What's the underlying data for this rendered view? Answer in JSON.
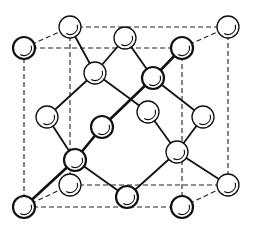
{
  "diagram": {
    "colors": {
      "line": "#111111",
      "atom_fill": "#ffffff",
      "background": "#ffffff"
    },
    "atom_radius": 11,
    "cube": {
      "front": [
        [
          24,
          48
        ],
        [
          182,
          48
        ],
        [
          182,
          207
        ],
        [
          24,
          207
        ]
      ],
      "back": [
        [
          70,
          27
        ],
        [
          228,
          27
        ],
        [
          228,
          185
        ],
        [
          70,
          185
        ]
      ]
    },
    "atoms": [
      {
        "id": "back-top-left",
        "x": 70,
        "y": 27,
        "type": "corner"
      },
      {
        "id": "back-top-right",
        "x": 228,
        "y": 27,
        "type": "corner"
      },
      {
        "id": "back-bottom-left",
        "x": 70,
        "y": 185,
        "type": "corner"
      },
      {
        "id": "back-bottom-right",
        "x": 228,
        "y": 185,
        "type": "corner"
      },
      {
        "id": "front-top-left",
        "x": 24,
        "y": 48,
        "type": "corner",
        "front": true
      },
      {
        "id": "front-top-right",
        "x": 182,
        "y": 48,
        "type": "corner",
        "front": true
      },
      {
        "id": "front-bottom-left",
        "x": 24,
        "y": 207,
        "type": "corner",
        "front": true
      },
      {
        "id": "front-bottom-right",
        "x": 182,
        "y": 207,
        "type": "corner",
        "front": true
      },
      {
        "id": "face-top",
        "x": 125,
        "y": 38,
        "type": "face"
      },
      {
        "id": "face-bottom",
        "x": 127,
        "y": 197,
        "type": "face",
        "front": true
      },
      {
        "id": "face-left",
        "x": 47,
        "y": 117,
        "type": "face"
      },
      {
        "id": "face-right",
        "x": 203,
        "y": 117,
        "type": "face"
      },
      {
        "id": "face-front",
        "x": 102,
        "y": 127,
        "type": "face",
        "front": true
      },
      {
        "id": "face-back",
        "x": 148,
        "y": 112,
        "type": "face"
      },
      {
        "id": "interior-1",
        "x": 95,
        "y": 73,
        "type": "interior"
      },
      {
        "id": "interior-2",
        "x": 153,
        "y": 78,
        "type": "interior",
        "front": true
      },
      {
        "id": "interior-3",
        "x": 75,
        "y": 160,
        "type": "interior",
        "front": true
      },
      {
        "id": "interior-4",
        "x": 177,
        "y": 152,
        "type": "interior"
      }
    ],
    "bonds": [
      {
        "from": "interior-1",
        "to": "back-top-left"
      },
      {
        "from": "interior-1",
        "to": "face-top"
      },
      {
        "from": "interior-1",
        "to": "face-left"
      },
      {
        "from": "interior-1",
        "to": "face-back"
      },
      {
        "from": "interior-2",
        "to": "face-top"
      },
      {
        "from": "interior-2",
        "to": "front-top-right",
        "front": true
      },
      {
        "from": "interior-2",
        "to": "face-right"
      },
      {
        "from": "interior-2",
        "to": "face-front",
        "front": true
      },
      {
        "from": "interior-3",
        "to": "face-left"
      },
      {
        "from": "interior-3",
        "to": "face-front",
        "front": true
      },
      {
        "from": "interior-3",
        "to": "front-bottom-left",
        "front": true
      },
      {
        "from": "interior-3",
        "to": "face-bottom"
      },
      {
        "from": "interior-4",
        "to": "face-back"
      },
      {
        "from": "interior-4",
        "to": "face-right"
      },
      {
        "from": "interior-4",
        "to": "back-bottom-right"
      },
      {
        "from": "interior-4",
        "to": "face-bottom"
      }
    ]
  }
}
